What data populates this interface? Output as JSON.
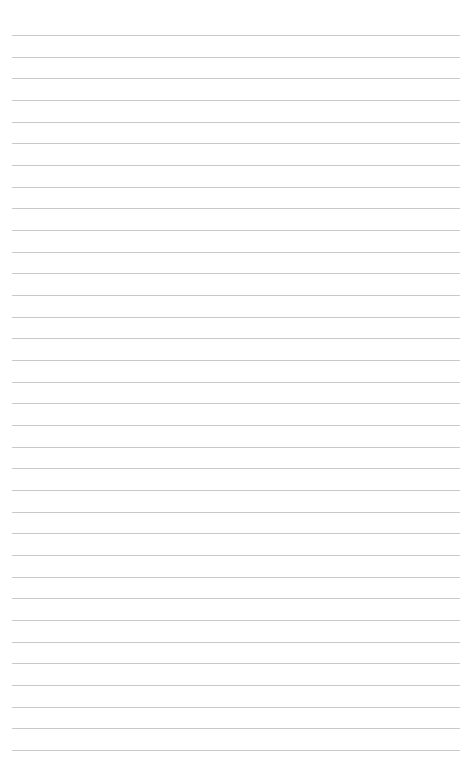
{
  "page": {
    "type": "lined-paper",
    "background_color": "#ffffff",
    "line_color": "#c9c9c9",
    "line_count": 34,
    "first_line_y": 35,
    "line_spacing": 21.67,
    "line_left": 12,
    "line_right": 460
  }
}
